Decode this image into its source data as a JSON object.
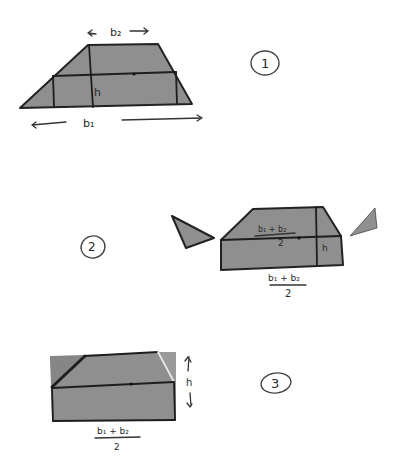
{
  "diagram": {
    "colors": {
      "fill": "#8f8f8f",
      "stroke": "#222222",
      "background": "#ffffff"
    },
    "steps": [
      {
        "number": "1",
        "labels": {
          "top_base": "b₂",
          "bottom_base": "b₁",
          "height": "h"
        },
        "description": "Trapezoid with bases b1, b2 and height h; midline drawn"
      },
      {
        "number": "2",
        "labels": {
          "midline_num": "b₁ + b₂",
          "midline_den": "2",
          "bottom_num": "b₁ + b₂",
          "bottom_den": "2",
          "height": "h"
        },
        "description": "Corner triangles above midline cut off"
      },
      {
        "number": "3",
        "labels": {
          "bottom_num": "b₁ + b₂",
          "bottom_den": "2",
          "height": "h"
        },
        "description": "Triangles rotated to form rectangle of width (b1+b2)/2 and height h"
      }
    ]
  }
}
